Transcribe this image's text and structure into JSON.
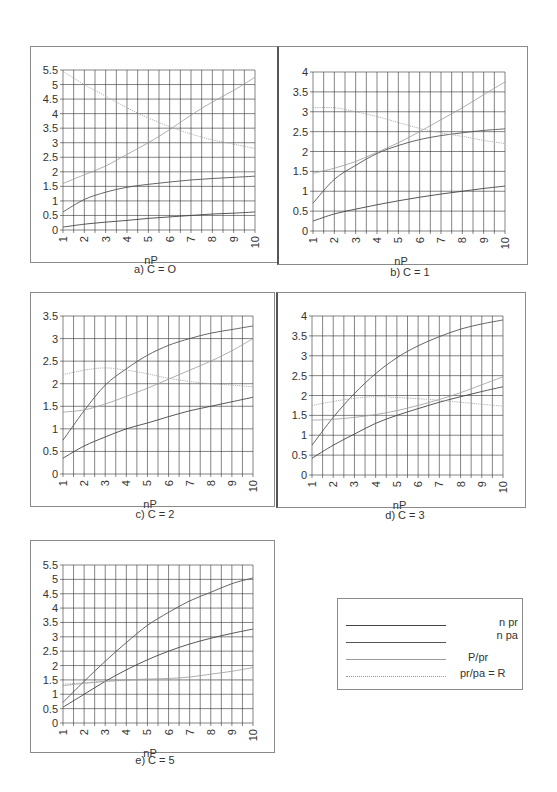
{
  "chart_data": [
    {
      "id": "a",
      "type": "line",
      "title": "a) C = O",
      "xlabel": "nP",
      "ylabel": "",
      "x": [
        1,
        2,
        3,
        4,
        5,
        6,
        7,
        8,
        9,
        10
      ],
      "xlim": [
        1,
        10
      ],
      "ylim": [
        0,
        5.5
      ],
      "yticks": [
        "0",
        "0.5",
        "1",
        "1.5",
        "2",
        "2.5",
        "3",
        "3.5",
        "4",
        "4.5",
        "5",
        "5.5"
      ],
      "grid": true,
      "series": [
        {
          "name": "n pr",
          "values": [
            0.1,
            0.2,
            0.27,
            0.33,
            0.4,
            0.45,
            0.5,
            0.55,
            0.58,
            0.62
          ]
        },
        {
          "name": "n pa",
          "values": [
            0.62,
            1.05,
            1.3,
            1.47,
            1.57,
            1.65,
            1.72,
            1.77,
            1.81,
            1.85
          ]
        },
        {
          "name": "P/pr",
          "values": [
            1.6,
            1.9,
            2.2,
            2.6,
            3.0,
            3.45,
            3.95,
            4.4,
            4.8,
            5.25
          ]
        },
        {
          "name": "pr/pa = R",
          "values": [
            5.45,
            5.0,
            4.6,
            4.2,
            3.85,
            3.55,
            3.3,
            3.1,
            2.95,
            2.8
          ]
        }
      ]
    },
    {
      "id": "b",
      "type": "line",
      "title": "b) C = 1",
      "xlabel": "nP",
      "ylabel": "",
      "x": [
        1,
        2,
        3,
        4,
        5,
        6,
        7,
        8,
        9,
        10
      ],
      "xlim": [
        1,
        10
      ],
      "ylim": [
        0,
        4
      ],
      "yticks": [
        "0",
        "0.5",
        "1",
        "1.5",
        "2",
        "2.5",
        "3",
        "3.5",
        "4"
      ],
      "grid": true,
      "series": [
        {
          "name": "n pr",
          "values": [
            0.25,
            0.43,
            0.55,
            0.66,
            0.76,
            0.85,
            0.93,
            1.0,
            1.07,
            1.13
          ]
        },
        {
          "name": "n pa",
          "values": [
            0.7,
            1.3,
            1.65,
            1.95,
            2.15,
            2.3,
            2.4,
            2.47,
            2.53,
            2.57
          ]
        },
        {
          "name": "P/pr",
          "values": [
            1.45,
            1.58,
            1.75,
            1.98,
            2.22,
            2.5,
            2.8,
            3.1,
            3.43,
            3.75
          ]
        },
        {
          "name": "pr/pa = R",
          "values": [
            3.1,
            3.1,
            3.0,
            2.88,
            2.73,
            2.58,
            2.47,
            2.38,
            2.28,
            2.2
          ]
        }
      ]
    },
    {
      "id": "c",
      "type": "line",
      "title": "c) C = 2",
      "xlabel": "nP",
      "ylabel": "",
      "x": [
        1,
        2,
        3,
        4,
        5,
        6,
        7,
        8,
        9,
        10
      ],
      "xlim": [
        1,
        10
      ],
      "ylim": [
        0,
        3.5
      ],
      "yticks": [
        "0",
        "0.5",
        "1",
        "1.5",
        "2",
        "2.5",
        "3",
        "3.5"
      ],
      "grid": true,
      "series": [
        {
          "name": "n pr",
          "values": [
            0.35,
            0.62,
            0.82,
            1.0,
            1.13,
            1.27,
            1.4,
            1.5,
            1.6,
            1.7
          ]
        },
        {
          "name": "n pa",
          "values": [
            0.75,
            1.4,
            1.97,
            2.33,
            2.63,
            2.85,
            3.0,
            3.12,
            3.2,
            3.28
          ]
        },
        {
          "name": "P/pr",
          "values": [
            1.37,
            1.42,
            1.55,
            1.72,
            1.9,
            2.1,
            2.3,
            2.5,
            2.73,
            3.0
          ]
        },
        {
          "name": "pr/pa = R",
          "values": [
            2.2,
            2.3,
            2.35,
            2.3,
            2.22,
            2.12,
            2.05,
            2.0,
            1.97,
            1.93
          ]
        }
      ]
    },
    {
      "id": "d",
      "type": "line",
      "title": "d) C = 3",
      "xlabel": "nP",
      "ylabel": "",
      "x": [
        1,
        2,
        3,
        4,
        5,
        6,
        7,
        8,
        9,
        10
      ],
      "xlim": [
        1,
        10
      ],
      "ylim": [
        0,
        4
      ],
      "yticks": [
        "0",
        "0.5",
        "1",
        "1.5",
        "2",
        "2.5",
        "3",
        "3.5",
        "4"
      ],
      "grid": true,
      "series": [
        {
          "name": "n pr",
          "values": [
            0.42,
            0.75,
            1.03,
            1.3,
            1.5,
            1.67,
            1.83,
            1.97,
            2.1,
            2.22
          ]
        },
        {
          "name": "n pa",
          "values": [
            0.75,
            1.45,
            2.05,
            2.55,
            2.95,
            3.25,
            3.48,
            3.67,
            3.8,
            3.9
          ]
        },
        {
          "name": "P/pr",
          "values": [
            1.38,
            1.4,
            1.45,
            1.52,
            1.62,
            1.75,
            1.9,
            2.07,
            2.27,
            2.47
          ]
        },
        {
          "name": "pr/pa = R",
          "values": [
            1.75,
            1.85,
            1.93,
            1.97,
            1.95,
            1.92,
            1.88,
            1.83,
            1.78,
            1.73
          ]
        }
      ]
    },
    {
      "id": "e",
      "type": "line",
      "title": "e) C = 5",
      "xlabel": "nP",
      "ylabel": "",
      "x": [
        1,
        2,
        3,
        4,
        5,
        6,
        7,
        8,
        9,
        10
      ],
      "xlim": [
        1,
        10
      ],
      "ylim": [
        0,
        5.5
      ],
      "yticks": [
        "0",
        "0.5",
        "1",
        "1.5",
        "2",
        "2.5",
        "3",
        "3.5",
        "4",
        "4.5",
        "5",
        "5.5"
      ],
      "grid": true,
      "series": [
        {
          "name": "n pr",
          "values": [
            0.55,
            1.0,
            1.45,
            1.85,
            2.2,
            2.5,
            2.75,
            2.95,
            3.12,
            3.27
          ]
        },
        {
          "name": "n pa",
          "values": [
            0.72,
            1.45,
            2.15,
            2.8,
            3.4,
            3.85,
            4.25,
            4.55,
            4.85,
            5.05
          ]
        },
        {
          "name": "P/pr",
          "values": [
            1.3,
            1.38,
            1.45,
            1.5,
            1.53,
            1.55,
            1.6,
            1.7,
            1.8,
            1.93
          ]
        },
        {
          "name": "pr/pa = R",
          "values": [
            1.35,
            1.4,
            1.45,
            1.48,
            1.5,
            1.5,
            1.5,
            1.5,
            1.5,
            1.5
          ]
        }
      ]
    }
  ],
  "legend": {
    "items": [
      {
        "label": "n pr",
        "style": "solid-dark"
      },
      {
        "label": "n pa",
        "style": "solid-dark"
      },
      {
        "label": "P/pr",
        "style": "solid-light"
      },
      {
        "label": "pr/pa = R",
        "style": "dotted-light"
      }
    ]
  },
  "colors": {
    "n_pr": "#444444",
    "n_pa": "#555555",
    "p_pr": "#9a9a9a",
    "pr_pa": "#a8a8a8",
    "grid": "#333333",
    "frame": "#8a8a8a"
  }
}
